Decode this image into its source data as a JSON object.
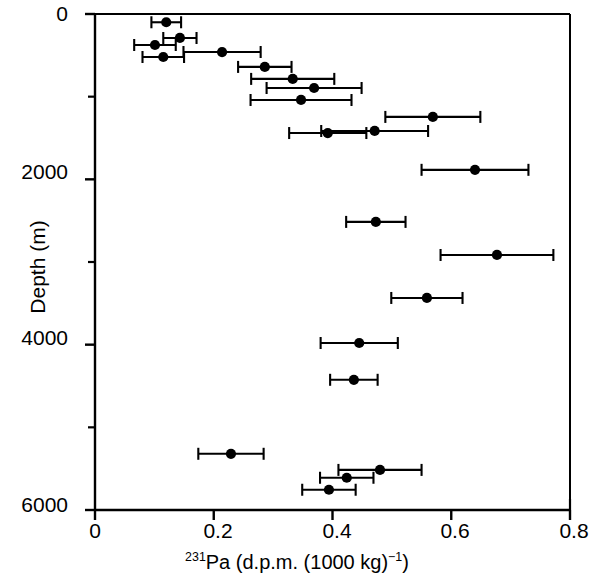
{
  "chart_data": {
    "type": "scatter",
    "title": "",
    "xlabel_parts": {
      "sup": "231",
      "rest": "Pa (d.p.m. (1000 kg)",
      "sup2": "−1",
      "tail": ")"
    },
    "xlabel": "231Pa (d.p.m. (1000 kg)−1)",
    "ylabel": "Depth (m)",
    "xlim": [
      0,
      0.8
    ],
    "ylim": [
      0,
      6000
    ],
    "y_inverted": true,
    "grid": false,
    "legend": null,
    "xticks": [
      0,
      0.2,
      0.4,
      0.6,
      0.8
    ],
    "xtick_labels": [
      "0",
      "0.2",
      "0.4",
      "0.6",
      "0.8"
    ],
    "yticks": [
      0,
      2000,
      4000,
      6000
    ],
    "ytick_labels": [
      "0",
      "2000",
      "4000",
      "6000"
    ],
    "y_minor_ticks": [
      1000,
      3000,
      5000
    ],
    "marker": "filled-circle",
    "marker_color": "#000000",
    "errorbar_orientation": "horizontal",
    "errorbar_capstyle": "bar",
    "points": [
      {
        "x": 0.12,
        "y": 100,
        "xerr": 0.025
      },
      {
        "x": 0.143,
        "y": 290,
        "xerr": 0.028
      },
      {
        "x": 0.101,
        "y": 375,
        "xerr": 0.035
      },
      {
        "x": 0.115,
        "y": 520,
        "xerr": 0.035
      },
      {
        "x": 0.214,
        "y": 460,
        "xerr": 0.065
      },
      {
        "x": 0.286,
        "y": 640,
        "xerr": 0.045
      },
      {
        "x": 0.333,
        "y": 785,
        "xerr": 0.07
      },
      {
        "x": 0.369,
        "y": 895,
        "xerr": 0.08
      },
      {
        "x": 0.347,
        "y": 1040,
        "xerr": 0.085
      },
      {
        "x": 0.569,
        "y": 1245,
        "xerr": 0.08
      },
      {
        "x": 0.471,
        "y": 1415,
        "xerr": 0.09
      },
      {
        "x": 0.392,
        "y": 1440,
        "xerr": 0.065
      },
      {
        "x": 0.64,
        "y": 1885,
        "xerr": 0.09
      },
      {
        "x": 0.473,
        "y": 2515,
        "xerr": 0.05
      },
      {
        "x": 0.677,
        "y": 2915,
        "xerr": 0.095
      },
      {
        "x": 0.559,
        "y": 3435,
        "xerr": 0.06
      },
      {
        "x": 0.445,
        "y": 3980,
        "xerr": 0.065
      },
      {
        "x": 0.436,
        "y": 4425,
        "xerr": 0.04
      },
      {
        "x": 0.229,
        "y": 5320,
        "xerr": 0.055
      },
      {
        "x": 0.48,
        "y": 5515,
        "xerr": 0.07
      },
      {
        "x": 0.424,
        "y": 5610,
        "xerr": 0.045
      },
      {
        "x": 0.394,
        "y": 5755,
        "xerr": 0.045
      }
    ]
  },
  "axes": {
    "colors": {
      "axis": "#000000",
      "marker": "#000000",
      "background": "#ffffff"
    }
  }
}
